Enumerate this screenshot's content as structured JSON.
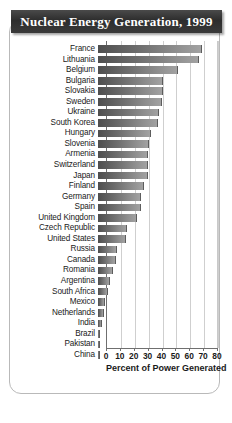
{
  "title": "Nuclear Energy Generation, 1999",
  "axis_title": "Percent of Power Generated",
  "chart_data": {
    "type": "bar",
    "orientation": "horizontal",
    "title": "Nuclear Energy Generation, 1999",
    "xlabel": "Percent of Power Generated",
    "ylabel": "",
    "xlim": [
      0,
      80
    ],
    "xticks": [
      0,
      10,
      20,
      30,
      40,
      50,
      60,
      70,
      80
    ],
    "grid": true,
    "legend": "none",
    "categories": [
      "France",
      "Lithuania",
      "Belgium",
      "Bulgaria",
      "Slovakia",
      "Sweden",
      "Ukraine",
      "South Korea",
      "Hungary",
      "Slovenia",
      "Armenia",
      "Switzerland",
      "Japan",
      "Finland",
      "Germany",
      "Spain",
      "United Kingdom",
      "Czech Republic",
      "United States",
      "Russia",
      "Canada",
      "Romania",
      "Argentina",
      "South Africa",
      "Mexico",
      "Netherlands",
      "India",
      "Brazil",
      "Pakistan",
      "China"
    ],
    "values": [
      75,
      73,
      58,
      47,
      47,
      46,
      44,
      43,
      38,
      37,
      36,
      36,
      36,
      33,
      31,
      31,
      28,
      21,
      20,
      14,
      13,
      11,
      9,
      7,
      5,
      4,
      3,
      1,
      1,
      1
    ]
  }
}
